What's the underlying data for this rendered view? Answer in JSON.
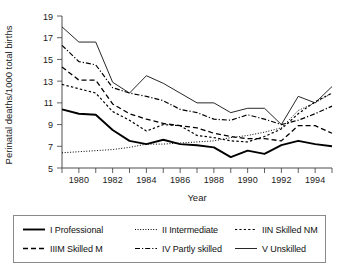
{
  "chart_data": {
    "type": "line",
    "title": "",
    "xlabel": "Year",
    "ylabel": "Perinatal deaths/1000 total births",
    "xlim": [
      1979,
      1995
    ],
    "ylim": [
      5,
      19
    ],
    "ytick_step": 2,
    "yticks": [
      5,
      7,
      9,
      11,
      13,
      15,
      17,
      19
    ],
    "xticks_major": [
      1980,
      1982,
      1984,
      1986,
      1988,
      1990,
      1992,
      1994
    ],
    "xticks_minor": [
      1979,
      1981,
      1983,
      1985,
      1987,
      1989,
      1991,
      1993,
      1995
    ],
    "grid": false,
    "legend_position": "bottom",
    "x": [
      1979,
      1980,
      1981,
      1982,
      1983,
      1984,
      1985,
      1986,
      1987,
      1988,
      1989,
      1990,
      1991,
      1992,
      1993,
      1994,
      1995
    ],
    "series": [
      {
        "name": "I Professional",
        "style": "solid-thick",
        "values": [
          10.4,
          10.0,
          9.9,
          8.5,
          7.5,
          7.2,
          7.6,
          7.2,
          7.1,
          6.9,
          6.0,
          6.6,
          6.3,
          7.1,
          7.5,
          7.2,
          7.0
        ]
      },
      {
        "name": "II Intermediate",
        "style": "dotted",
        "values": [
          6.4,
          6.5,
          6.6,
          6.7,
          6.9,
          7.2,
          7.2,
          7.3,
          7.4,
          7.5,
          7.8,
          8.0,
          8.3,
          8.7,
          10.3,
          11.0,
          11.9
        ]
      },
      {
        "name": "IIIN Skilled NM",
        "style": "dashed-short",
        "values": [
          12.7,
          12.3,
          11.9,
          10.2,
          9.4,
          8.4,
          9.0,
          8.9,
          8.0,
          7.8,
          7.5,
          7.4,
          7.9,
          8.6,
          10.0,
          11.1,
          11.9
        ]
      },
      {
        "name": "IIIM Skilled M",
        "style": "dashed-long",
        "values": [
          14.3,
          13.1,
          13.1,
          10.9,
          10.0,
          9.5,
          9.1,
          8.9,
          8.7,
          8.2,
          7.9,
          7.7,
          7.7,
          7.5,
          8.9,
          8.9,
          8.2
        ]
      },
      {
        "name": "IV Partly skilled",
        "style": "dash-dot",
        "values": [
          16.3,
          14.8,
          14.5,
          12.4,
          11.9,
          11.6,
          11.2,
          10.4,
          10.1,
          9.5,
          9.4,
          9.9,
          9.5,
          9.0,
          9.4,
          10.0,
          10.7
        ]
      },
      {
        "name": "V Unskilled",
        "style": "solid-thin",
        "values": [
          18.0,
          16.6,
          16.6,
          12.9,
          11.9,
          13.5,
          12.8,
          11.9,
          11.0,
          11.0,
          10.1,
          10.5,
          10.5,
          9.0,
          11.6,
          11.0,
          12.5
        ]
      }
    ]
  },
  "legend": {
    "entries": [
      {
        "label": "I Professional",
        "style": "solid-thick"
      },
      {
        "label": "II Intermediate",
        "style": "dotted"
      },
      {
        "label": "IIN Skilled NM",
        "style": "dashed-short"
      },
      {
        "label": "IIIM Skilled M",
        "style": "dashed-long"
      },
      {
        "label": "IV Partly skilled",
        "style": "dash-dot"
      },
      {
        "label": "V Unskilled",
        "style": "solid-thin"
      }
    ]
  },
  "axes": {
    "y_title": "Perinatal deaths/1000 total births",
    "x_title": "Year",
    "y_labels": [
      "19",
      "17",
      "15",
      "13",
      "11",
      "9",
      "7",
      "5"
    ],
    "x_labels": [
      "1980",
      "1982",
      "1984",
      "1986",
      "1988",
      "1990",
      "1992",
      "1994"
    ]
  },
  "colors": {
    "ink": "#000000",
    "axis": "#3a3a3a",
    "legend_border": "#8a8a8a",
    "background": "#ffffff"
  }
}
